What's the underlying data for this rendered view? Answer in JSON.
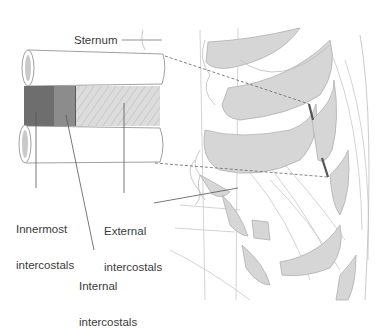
{
  "diagram": {
    "type": "anatomical-illustration",
    "labels": {
      "sternum": "Sternum",
      "innermost": [
        "Innermost",
        "intercostals"
      ],
      "external": [
        "External",
        "intercostals"
      ],
      "internal": [
        "Internal",
        "intercostals"
      ]
    },
    "inset": {
      "layers": [
        {
          "name": "Innermost intercostals",
          "shade": "#6e6e6e"
        },
        {
          "name": "Internal intercostals",
          "shade": "#8c8c8c"
        },
        {
          "name": "External intercostals",
          "shade": "#d9d9d9",
          "pattern": "diagonal hatch"
        }
      ],
      "ribs": 2
    },
    "colors": {
      "outline": "#9a9a9a",
      "line": "#555555",
      "rib_fill": "#d6d6d6",
      "background": "#ffffff"
    }
  }
}
